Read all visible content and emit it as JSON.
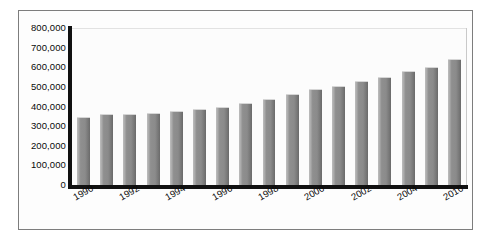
{
  "chart_data": {
    "type": "bar",
    "title": "",
    "subtitle": "",
    "xlabel": "",
    "ylabel": "",
    "ylim": [
      0,
      800000
    ],
    "ytick_labels": [
      "800,000",
      "700,000",
      "600,000",
      "500,000",
      "400,000",
      "300,000",
      "200,000",
      "100,000",
      "0"
    ],
    "ytick_values": [
      800000,
      700000,
      600000,
      500000,
      400000,
      300000,
      200000,
      100000,
      0
    ],
    "grid": false,
    "legend": "none",
    "bar_color": "#8b8b8b",
    "axis_color": "#111111",
    "frame_color": "#7d7d7d",
    "background": "#ffffff",
    "categories": [
      "1990",
      "1991",
      "1992",
      "1993",
      "1994",
      "1995",
      "1996",
      "1997",
      "1998",
      "1999",
      "2000",
      "2001",
      "2002",
      "2003",
      "2004",
      "2005",
      "2010"
    ],
    "visible_xtick_labels": [
      "1990",
      "1992",
      "1994",
      "1996",
      "1998",
      "2000",
      "2002",
      "2004",
      "2010"
    ],
    "values": [
      345000,
      360000,
      363000,
      368000,
      375000,
      385000,
      398000,
      420000,
      440000,
      462000,
      487000,
      505000,
      532000,
      552000,
      580000,
      602000,
      640000
    ]
  },
  "chart_series": {
    "bars": [
      {
        "category": "1990",
        "value": 345000,
        "label_shown": "1990"
      },
      {
        "category": "1991",
        "value": 360000,
        "label_shown": ""
      },
      {
        "category": "1992",
        "value": 363000,
        "label_shown": "1992"
      },
      {
        "category": "1993",
        "value": 368000,
        "label_shown": ""
      },
      {
        "category": "1994",
        "value": 375000,
        "label_shown": "1994"
      },
      {
        "category": "1995",
        "value": 385000,
        "label_shown": ""
      },
      {
        "category": "1996",
        "value": 398000,
        "label_shown": "1996"
      },
      {
        "category": "1997",
        "value": 420000,
        "label_shown": ""
      },
      {
        "category": "1998",
        "value": 440000,
        "label_shown": "1998"
      },
      {
        "category": "1999",
        "value": 462000,
        "label_shown": ""
      },
      {
        "category": "2000",
        "value": 487000,
        "label_shown": "2000"
      },
      {
        "category": "2001",
        "value": 505000,
        "label_shown": ""
      },
      {
        "category": "2002",
        "value": 532000,
        "label_shown": "2002"
      },
      {
        "category": "2003",
        "value": 552000,
        "label_shown": ""
      },
      {
        "category": "2004",
        "value": 580000,
        "label_shown": "2004"
      },
      {
        "category": "2005",
        "value": 602000,
        "label_shown": ""
      },
      {
        "category": "2010",
        "value": 640000,
        "label_shown": "2010"
      }
    ]
  }
}
